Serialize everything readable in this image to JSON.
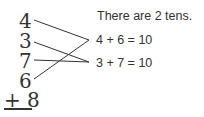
{
  "column": {
    "addends": [
      "4",
      "3",
      "7",
      "6"
    ],
    "last": "+ 8"
  },
  "statement": "There are 2 tens.",
  "equations": [
    "4 + 6 = 10",
    "3 + 7 = 10"
  ]
}
